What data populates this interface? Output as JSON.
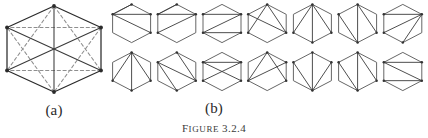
{
  "figure": {
    "caption_word": "Figure",
    "caption_number": "3.2.4",
    "label_a": "(a)",
    "label_b": "(b)",
    "colors": {
      "solid_edge": "#3a3a3a",
      "dashed_edge": "#8e8e8e",
      "outline": "#2b2b2b",
      "vertex": "#2b2b2b",
      "background": "#ffffff"
    }
  },
  "panel_a": {
    "name": "complete-graph-on-hexagon",
    "vertex_count": 6,
    "hexagon_vertices": [
      [
        0.5,
        0.0
      ],
      [
        1.0,
        0.25
      ],
      [
        1.0,
        0.75
      ],
      [
        0.5,
        1.0
      ],
      [
        0.0,
        0.75
      ],
      [
        0.0,
        0.25
      ]
    ],
    "solid_edges": [
      [
        0,
        1
      ],
      [
        1,
        2
      ],
      [
        2,
        3
      ],
      [
        3,
        4
      ],
      [
        4,
        5
      ],
      [
        5,
        0
      ],
      [
        0,
        3
      ],
      [
        1,
        4
      ],
      [
        2,
        5
      ]
    ],
    "dashed_edges": [
      [
        0,
        2
      ],
      [
        0,
        4
      ],
      [
        1,
        3
      ],
      [
        1,
        5
      ],
      [
        2,
        4
      ],
      [
        3,
        5
      ]
    ]
  },
  "panel_b": {
    "name": "hexagon-triangulations",
    "rows": 2,
    "columns": 7,
    "total": 14,
    "hexagon_vertices": [
      [
        0.5,
        0.0
      ],
      [
        1.0,
        0.26
      ],
      [
        1.0,
        0.74
      ],
      [
        0.5,
        1.0
      ],
      [
        0.0,
        0.74
      ],
      [
        0.0,
        0.26
      ]
    ],
    "triangulations": [
      {
        "id": 1,
        "row": 1,
        "col": 1,
        "diagonals": [
          [
            5,
            0
          ],
          [
            5,
            1
          ],
          [
            5,
            2
          ]
        ]
      },
      {
        "id": 2,
        "row": 1,
        "col": 2,
        "diagonals": [
          [
            5,
            0
          ],
          [
            5,
            1
          ],
          [
            1,
            4
          ]
        ]
      },
      {
        "id": 3,
        "row": 1,
        "col": 3,
        "diagonals": [
          [
            5,
            1
          ],
          [
            4,
            1
          ],
          [
            4,
            2
          ]
        ]
      },
      {
        "id": 4,
        "row": 1,
        "col": 4,
        "diagonals": [
          [
            0,
            2
          ],
          [
            5,
            2
          ],
          [
            0,
            4
          ]
        ]
      },
      {
        "id": 5,
        "row": 1,
        "col": 5,
        "diagonals": [
          [
            0,
            2
          ],
          [
            0,
            3
          ],
          [
            0,
            4
          ]
        ]
      },
      {
        "id": 6,
        "row": 1,
        "col": 6,
        "diagonals": [
          [
            0,
            2
          ],
          [
            0,
            3
          ],
          [
            3,
            5
          ]
        ]
      },
      {
        "id": 7,
        "row": 1,
        "col": 7,
        "diagonals": [
          [
            1,
            5
          ],
          [
            1,
            4
          ],
          [
            1,
            3
          ]
        ]
      }
    ],
    "triangulations_row2": [
      {
        "id": 8,
        "row": 2,
        "col": 1,
        "diagonals": [
          [
            0,
            2
          ],
          [
            0,
            3
          ],
          [
            0,
            4
          ]
        ]
      },
      {
        "id": 9,
        "row": 2,
        "col": 2,
        "diagonals": [
          [
            0,
            2
          ],
          [
            2,
            5
          ],
          [
            5,
            3
          ]
        ]
      },
      {
        "id": 10,
        "row": 2,
        "col": 3,
        "diagonals": [
          [
            5,
            1
          ],
          [
            5,
            2
          ],
          [
            4,
            1
          ]
        ]
      },
      {
        "id": 11,
        "row": 2,
        "col": 4,
        "diagonals": [
          [
            4,
            0
          ],
          [
            4,
            1
          ],
          [
            0,
            2
          ]
        ]
      },
      {
        "id": 12,
        "row": 2,
        "col": 5,
        "diagonals": [
          [
            3,
            5
          ],
          [
            3,
            0
          ],
          [
            3,
            1
          ]
        ]
      },
      {
        "id": 13,
        "row": 2,
        "col": 6,
        "diagonals": [
          [
            3,
            5
          ],
          [
            3,
            0
          ],
          [
            0,
            2
          ]
        ]
      },
      {
        "id": 14,
        "row": 2,
        "col": 7,
        "diagonals": [
          [
            5,
            2
          ],
          [
            5,
            1
          ],
          [
            2,
            4
          ]
        ]
      }
    ]
  }
}
